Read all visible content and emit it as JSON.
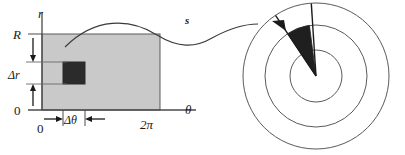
{
  "figure": {
    "colors": {
      "rect_fill": "#c9c9c9",
      "rect_stroke": "#5a5a5a",
      "cell_fill": "#2b2b2b",
      "axis": "#4a4a4a",
      "curve": "#3a3a3a",
      "wedge_fill": "#1f1f1f",
      "circle_stroke": "#5a5a5a",
      "text": "#1a1a1a",
      "background": "#ffffff"
    },
    "left_panel": {
      "name": "rectangular-parameter-domain",
      "axes": {
        "vertical_axis_label": "r",
        "horizontal_axis_label": "θ",
        "origin_label_vertical": "0",
        "origin_label_horizontal": "0",
        "r_max_label": "R",
        "theta_max_label": "2π"
      },
      "increments": {
        "delta_r_label": "Δr",
        "delta_theta_label": "Δθ"
      }
    },
    "mapping": {
      "name": "mapping-arrow",
      "label": "s"
    },
    "right_panel": {
      "name": "polar-annulus-image",
      "circle_count": 3,
      "wedge_label": ""
    }
  }
}
